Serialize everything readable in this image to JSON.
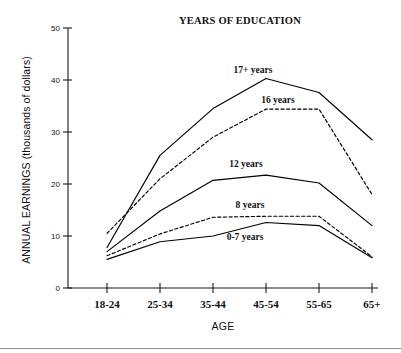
{
  "chart_data": {
    "type": "line",
    "title": "YEARS OF EDUCATION",
    "xlabel": "AGE",
    "ylabel": "ANNUAL EARNINGS (thousands of dollars)",
    "categories": [
      "18-24",
      "25-34",
      "35-44",
      "45-54",
      "55-65",
      "65+"
    ],
    "ylim": [
      0,
      50
    ],
    "yticks": [
      0,
      10,
      20,
      30,
      40,
      50
    ],
    "ytick_labels": [
      "0",
      "10",
      "20",
      "30",
      "40",
      "50"
    ],
    "grid": false,
    "legend_position": "inline-labels",
    "series": [
      {
        "name": "17+ years",
        "style": "solid",
        "label": "17+ years",
        "values": [
          7.8,
          25.5,
          34.5,
          40.3,
          37.6,
          28.5
        ]
      },
      {
        "name": "16 years",
        "style": "dashed",
        "label": "16 years",
        "values": [
          10.5,
          21.0,
          29.0,
          34.4,
          34.4,
          18.0
        ]
      },
      {
        "name": "12 years",
        "style": "solid",
        "label": "12 years",
        "values": [
          7.0,
          14.8,
          20.7,
          21.7,
          20.2,
          12.0
        ]
      },
      {
        "name": "8 years",
        "style": "dashed",
        "label": "8 years",
        "values": [
          6.2,
          10.4,
          13.6,
          13.8,
          13.8,
          6.0
        ]
      },
      {
        "name": "0-7 years",
        "style": "solid",
        "label": "0-7 years",
        "values": [
          5.5,
          8.9,
          10.0,
          12.6,
          12.0,
          5.8
        ]
      }
    ],
    "series_label_positions": [
      {
        "name": "17+ years",
        "x": 253,
        "y": 73
      },
      {
        "name": "16 years",
        "x": 278,
        "y": 103
      },
      {
        "name": "12 years",
        "x": 246,
        "y": 167
      },
      {
        "name": "8 years",
        "x": 250,
        "y": 208
      },
      {
        "name": "0-7 years",
        "x": 245,
        "y": 240
      }
    ]
  }
}
